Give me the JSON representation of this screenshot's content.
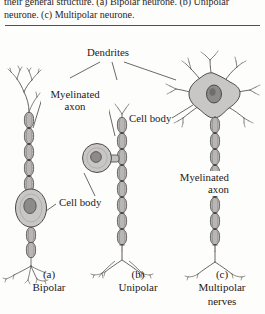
{
  "figure": {
    "caption": {
      "line1": "their general structure. (a) Bipolar neurone. (b) Unipolar",
      "line2": "neurone. (c) Multipolar neurone.",
      "a_tag": "(a)",
      "a_italic": "a",
      "b_italic": "b",
      "c_italic": "c"
    },
    "annotations": {
      "dendrites": "Dendrites",
      "myelinated_axon_left": "Myelinated axon",
      "myelinated_axon_left_l1": "Myelinated",
      "myelinated_axon_left_l2": "axon",
      "cell_body_1": "Cell body",
      "cell_body_2": "Cell body",
      "myelinated_axon_right": "Myelinated axon",
      "myelinated_axon_right_l1": "Myelinated",
      "myelinated_axon_right_l2": "axon"
    },
    "panels": [
      {
        "tag": "(a)",
        "name": "Bipolar",
        "name_line2": ""
      },
      {
        "tag": "(b)",
        "name": "Unipolar",
        "name_line2": ""
      },
      {
        "tag": "(c)",
        "name": "Multipolar",
        "name_line2": "nerves"
      }
    ],
    "colors": {
      "page_background": "#fdfdfc",
      "ink": "#1d1a18",
      "rule": "#55504c",
      "soma_fill": "#c9c7c5",
      "soma_stroke": "#4e4a47",
      "nucleus_fill": "#8d8a88",
      "nucleus_stroke": "#4a4744",
      "myelin_fill": "#b9b7b5",
      "myelin_stroke": "#514d4a",
      "dendrite_stroke": "#4f4b48",
      "leader_stroke": "#46423f"
    }
  }
}
